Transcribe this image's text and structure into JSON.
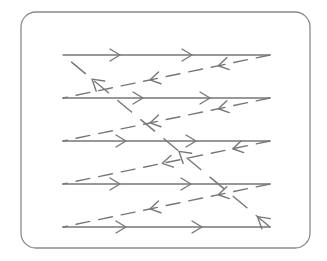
{
  "diagram": {
    "colors": {
      "line": "#777777",
      "frame": "#8a8a8a",
      "background": "#ffffff"
    },
    "frame": {
      "x": 21,
      "y": 12,
      "width": 289,
      "height": 236,
      "radius": 15
    },
    "scan_lines": [
      {
        "y": 55,
        "x1": 63,
        "x2": 270,
        "direction": "right",
        "arrows_x": [
          120,
          192
        ]
      },
      {
        "y": 98,
        "x1": 63,
        "x2": 270,
        "direction": "right",
        "arrows_x": [
          143,
          210
        ]
      },
      {
        "y": 141,
        "x1": 63,
        "x2": 270,
        "direction": "right",
        "arrows_x": [
          126,
          196
        ]
      },
      {
        "y": 184,
        "x1": 63,
        "x2": 270,
        "direction": "right",
        "arrows_x": [
          120,
          191
        ]
      },
      {
        "y": 227,
        "x1": 63,
        "x2": 270,
        "direction": "right",
        "arrows_x": [
          126,
          202
        ]
      }
    ],
    "retrace_lines": [
      {
        "from": [
          270,
          55
        ],
        "to": [
          63,
          98
        ],
        "direction": "left",
        "arrows_at": [
          0.25,
          0.58
        ]
      },
      {
        "from": [
          270,
          98
        ],
        "to": [
          63,
          141
        ],
        "direction": "left",
        "arrows_at": [
          0.25,
          0.58
        ]
      },
      {
        "from": [
          270,
          141
        ],
        "to": [
          63,
          184
        ],
        "direction": "left",
        "arrows_at": [
          0.18,
          0.52
        ]
      },
      {
        "from": [
          270,
          184
        ],
        "to": [
          63,
          227
        ],
        "direction": "left",
        "arrows_at": [
          0.25,
          0.58
        ]
      }
    ],
    "vertical_retrace": {
      "from": [
        270,
        227
      ],
      "to": [
        63,
        55
      ],
      "direction": "up-left",
      "arrows_at": [
        0.06,
        0.44,
        0.86
      ]
    }
  }
}
